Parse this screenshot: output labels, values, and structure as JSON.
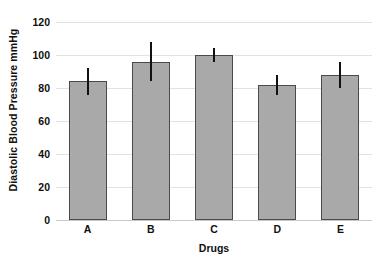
{
  "chart_data": {
    "type": "bar",
    "title": "",
    "xlabel": "Drugs",
    "ylabel": "Diastolic Blood Pressure mmHg",
    "categories": [
      "A",
      "B",
      "C",
      "D",
      "E"
    ],
    "values": [
      84,
      96,
      100,
      82,
      88
    ],
    "errors": [
      8,
      12,
      4,
      6,
      8
    ],
    "series": [
      {
        "name": "Diastolic Blood Pressure",
        "values": [
          84,
          96,
          100,
          82,
          88
        ],
        "errors": [
          8,
          12,
          4,
          6,
          8
        ]
      }
    ],
    "ylim": [
      0,
      120
    ],
    "ytick_labels": [
      "0",
      "20",
      "40",
      "60",
      "80",
      "100",
      "120"
    ],
    "ytick_values": [
      0,
      20,
      40,
      60,
      80,
      100,
      120
    ],
    "xlim_categories": 5,
    "grid": true,
    "grid_axis": "y",
    "legend": false,
    "legend_position": "none",
    "error_bar_style": "vertical-line-no-caps",
    "bar_fill_color": "#a9a9a9",
    "bar_edge_color": "#4a4a4a",
    "error_bar_color": "#111111",
    "grid_color": "#e2e2e2",
    "background_color": "#ffffff",
    "text_color": "#101010"
  }
}
